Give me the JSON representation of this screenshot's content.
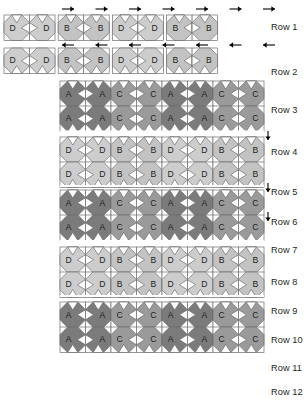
{
  "diagram": {
    "grid": {
      "columns": 8,
      "rows": 12,
      "cell_size": 25.5,
      "origin_x": 60,
      "detached_rows": [
        1,
        2
      ],
      "joined_rows": [
        3,
        4,
        5,
        6,
        7,
        8,
        9,
        10,
        11,
        12
      ]
    },
    "colors": {
      "block_a": "#7b7b7b",
      "block_b": "#c3c3c3",
      "block_c": "#9a9a9a",
      "block_d": "#cdcdcd",
      "background": "#ffffff",
      "outline": "#6d6d6d",
      "text": "#231f20",
      "arrow": "#000000"
    },
    "row_labels": [
      "Row 1",
      "Row 2",
      "Row 3",
      "Row 4",
      "Row 5",
      "Row 6",
      "Row 7",
      "Row 8",
      "Row 9",
      "Row 10",
      "Row 11",
      "Row 12"
    ],
    "row_label_y": [
      27,
      72,
      110,
      152,
      192,
      222,
      250,
      282,
      311,
      340,
      368,
      392
    ],
    "rows": [
      {
        "row": 1,
        "y": 15,
        "labels": [
          "D",
          "D",
          "B",
          "B",
          "D",
          "D",
          "B",
          "B"
        ],
        "style": "detached"
      },
      {
        "row": 2,
        "y": 48,
        "labels": [
          "D",
          "D",
          "B",
          "B",
          "D",
          "D",
          "B",
          "B"
        ],
        "style": "detached"
      },
      {
        "row": 3,
        "y": 81,
        "labels": [
          "A",
          "A",
          "C",
          "C",
          "A",
          "A",
          "C",
          "C"
        ],
        "style": "joined"
      },
      {
        "row": 4,
        "y": 106,
        "labels": [
          "A",
          "A",
          "C",
          "C",
          "A",
          "A",
          "C",
          "C"
        ],
        "style": "joined"
      },
      {
        "row": 5,
        "y": 137,
        "labels": [
          "D",
          "D",
          "B",
          "B",
          "D",
          "D",
          "B",
          "B"
        ],
        "style": "joined"
      },
      {
        "row": 6,
        "y": 162,
        "labels": [
          "D",
          "D",
          "B",
          "B",
          "D",
          "D",
          "B",
          "B"
        ],
        "style": "joined"
      },
      {
        "row": 7,
        "y": 190,
        "labels": [
          "A",
          "A",
          "C",
          "C",
          "A",
          "A",
          "C",
          "C"
        ],
        "style": "joined"
      },
      {
        "row": 8,
        "y": 215,
        "labels": [
          "A",
          "A",
          "C",
          "C",
          "A",
          "A",
          "C",
          "C"
        ],
        "style": "joined"
      },
      {
        "row": 9,
        "y": 247,
        "labels": [
          "D",
          "D",
          "B",
          "B",
          "D",
          "D",
          "B",
          "B"
        ],
        "style": "joined"
      },
      {
        "row": 10,
        "y": 272,
        "labels": [
          "D",
          "D",
          "B",
          "B",
          "D",
          "D",
          "B",
          "B"
        ],
        "style": "joined"
      },
      {
        "row": 11,
        "y": 302,
        "labels": [
          "A",
          "A",
          "C",
          "C",
          "A",
          "A",
          "C",
          "C"
        ],
        "style": "joined"
      },
      {
        "row": 12,
        "y": 327,
        "labels": [
          "A",
          "A",
          "C",
          "C",
          "A",
          "A",
          "C",
          "C"
        ],
        "style": "joined"
      }
    ],
    "arrows": {
      "top_right_pointing": {
        "count": 7,
        "direction": "right",
        "y": 9
      },
      "mid_left_pointing": {
        "count": 7,
        "direction": "left",
        "y": 45
      },
      "side_down_pointing": {
        "count": 3,
        "direction": "down",
        "x": 268,
        "ys": [
          131,
          183,
          212
        ]
      }
    },
    "block_letters": [
      "A",
      "B",
      "C",
      "D"
    ]
  }
}
